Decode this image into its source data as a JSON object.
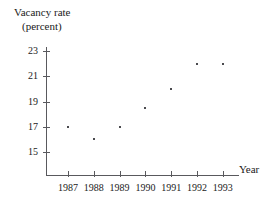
{
  "chart_data": {
    "type": "scatter",
    "title": "",
    "ylabel_lines": [
      "Vacancy rate",
      "(percent)"
    ],
    "ylabel": "Vacancy rate (percent)",
    "xlabel": "Year",
    "categories": [
      "1987",
      "1988",
      "1989",
      "1990",
      "1991",
      "1992",
      "1993"
    ],
    "x": [
      1987,
      1988,
      1989,
      1990,
      1991,
      1992,
      1993
    ],
    "values": [
      17,
      16,
      17,
      18.5,
      20,
      22,
      22
    ],
    "series": [
      {
        "name": "Vacancy rate",
        "values": [
          17,
          16,
          17,
          18.5,
          20,
          22,
          22
        ]
      }
    ],
    "y_ticks": [
      "23",
      "21",
      "19",
      "17",
      "15"
    ],
    "y_tick_values": [
      23,
      21,
      19,
      17,
      15
    ],
    "ylim": [
      13.6,
      23.9
    ],
    "xlim": [
      1986.5,
      1993.9
    ],
    "grid": false,
    "legend": false,
    "marker_color": "#4a4a4e",
    "axis_color": "#59595d"
  },
  "axes": {
    "y_title_line1": "Vacancy rate",
    "y_title_line2": "(percent)",
    "x_title": "Year"
  },
  "ticks": {
    "y": [
      {
        "label": "23",
        "value": 23
      },
      {
        "label": "21",
        "value": 21
      },
      {
        "label": "19",
        "value": 19
      },
      {
        "label": "17",
        "value": 17
      },
      {
        "label": "15",
        "value": 15
      }
    ],
    "x": [
      {
        "label": "1987",
        "value": 1987
      },
      {
        "label": "1988",
        "value": 1988
      },
      {
        "label": "1989",
        "value": 1989
      },
      {
        "label": "1990",
        "value": 1990
      },
      {
        "label": "1991",
        "value": 1991
      },
      {
        "label": "1992",
        "value": 1992
      },
      {
        "label": "1993",
        "value": 1993
      }
    ]
  }
}
